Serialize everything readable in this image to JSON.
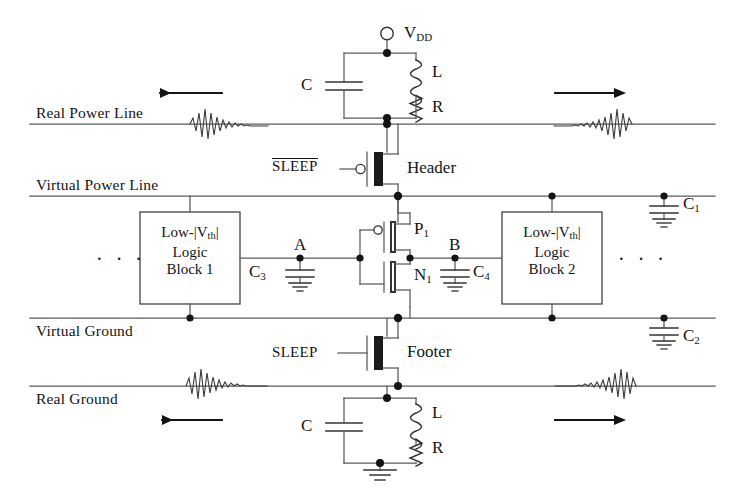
{
  "diagram": {
    "type": "schematic",
    "colors": {
      "wire": "#4a4a4a",
      "ink": "#141414",
      "transistor_fill": "#1a1a1a",
      "background": "#ffffff"
    }
  },
  "rails": [
    {
      "id": "real-power-line",
      "label": "Real Power Line",
      "y": 124
    },
    {
      "id": "virtual-power-line",
      "label": "Virtual Power Line",
      "y": 196
    },
    {
      "id": "virtual-ground-line",
      "label": "Virtual Ground",
      "y": 318
    },
    {
      "id": "real-ground-line",
      "label": "Real Ground",
      "y": 386
    }
  ],
  "supply": {
    "label": "V",
    "sub": "DD",
    "terminal": "open-circle"
  },
  "top_tank": {
    "capacitor_label": "C",
    "inductor_label": "L",
    "resistor_label": "R"
  },
  "bottom_tank": {
    "capacitor_label": "C",
    "inductor_label": "L",
    "resistor_label": "R"
  },
  "sleep_transistors": [
    {
      "id": "header",
      "name_label": "Header",
      "gate_signal": "SLEEP",
      "gate_signal_overline": true,
      "device_type": "pmos"
    },
    {
      "id": "footer",
      "name_label": "Footer",
      "gate_signal": "SLEEP",
      "gate_signal_overline": false,
      "device_type": "nmos"
    }
  ],
  "logic_blocks": [
    {
      "id": "logic-block-1",
      "line1_prefix": "Low-|V",
      "line1_sub": "th",
      "line1_suffix": "|",
      "line2": "Logic",
      "line3": "Block 1"
    },
    {
      "id": "logic-block-2",
      "line1_prefix": "Low-|V",
      "line1_sub": "th",
      "line1_suffix": "|",
      "line2": "Logic",
      "line3": "Block 2"
    }
  ],
  "inverter": {
    "pmos_label": "P",
    "pmos_sub": "1",
    "nmos_label": "N",
    "nmos_sub": "1"
  },
  "nodes": [
    {
      "id": "node-a",
      "label": "A"
    },
    {
      "id": "node-b",
      "label": "B"
    }
  ],
  "capacitors": [
    {
      "id": "cap-c1",
      "label": "C",
      "sub": "1",
      "attached_to": "virtual-power-line"
    },
    {
      "id": "cap-c2",
      "label": "C",
      "sub": "2",
      "attached_to": "virtual-ground-line"
    },
    {
      "id": "cap-c3",
      "label": "C",
      "sub": "3",
      "attached_to": "node-a"
    },
    {
      "id": "cap-c4",
      "label": "C",
      "sub": "4",
      "attached_to": "node-b"
    }
  ],
  "ellipses": [
    {
      "id": "ellipsis-left",
      "text": "· · ·"
    },
    {
      "id": "ellipsis-right",
      "text": "· · ·"
    }
  ],
  "current_arrows": [
    {
      "id": "arrow-top-left",
      "direction": "left",
      "rail": "real-power-line"
    },
    {
      "id": "arrow-top-right",
      "direction": "right",
      "rail": "real-power-line"
    },
    {
      "id": "arrow-bottom-left",
      "direction": "left",
      "rail": "real-ground-line"
    },
    {
      "id": "arrow-bottom-right",
      "direction": "right",
      "rail": "real-ground-line"
    }
  ],
  "noise_waveforms": [
    {
      "id": "noise-top-left",
      "rail": "real-power-line",
      "side": "left"
    },
    {
      "id": "noise-top-right",
      "rail": "real-power-line",
      "side": "right"
    },
    {
      "id": "noise-bottom-left",
      "rail": "real-ground-line",
      "side": "left"
    },
    {
      "id": "noise-bottom-right",
      "rail": "real-ground-line",
      "side": "right"
    }
  ]
}
